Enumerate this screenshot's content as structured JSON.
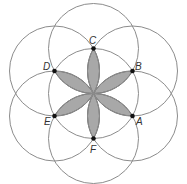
{
  "diagram": {
    "title": "",
    "center": {
      "x": 93.5,
      "y": 93.5
    },
    "radius": 45,
    "colors": {
      "circle_stroke": "#8c8c8c",
      "petal_fill": "#a8a8a8",
      "petal_stroke": "#555555",
      "point": "#111111",
      "label": "#333333"
    },
    "points": [
      {
        "id": "A",
        "label": "A",
        "x": 132.5,
        "y": 116,
        "lx": 136,
        "ly": 117
      },
      {
        "id": "B",
        "label": "B",
        "x": 132.5,
        "y": 71,
        "lx": 135,
        "ly": 62
      },
      {
        "id": "C",
        "label": "C",
        "x": 93.5,
        "y": 48.5,
        "lx": 89,
        "ly": 36
      },
      {
        "id": "D",
        "label": "D",
        "x": 54.5,
        "y": 71,
        "lx": 43,
        "ly": 62
      },
      {
        "id": "E",
        "label": "E",
        "x": 54.5,
        "y": 116,
        "lx": 44,
        "ly": 117
      },
      {
        "id": "F",
        "label": "F",
        "x": 93.5,
        "y": 138.5,
        "lx": 90,
        "ly": 145
      }
    ],
    "circles": [
      "O",
      "A",
      "B",
      "C",
      "D",
      "E",
      "F"
    ],
    "shaded_petals": 6
  }
}
